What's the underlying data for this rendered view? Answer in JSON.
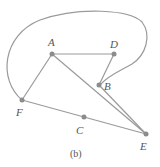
{
  "diagram": {
    "caption": "(b)",
    "colors": {
      "edge": "#9a9a9a",
      "node": "#8c8c8c",
      "text": "#555555"
    },
    "nodes": [
      {
        "id": "A",
        "label": "A",
        "x": 52,
        "y": 54
      },
      {
        "id": "D",
        "label": "D",
        "x": 114,
        "y": 54
      },
      {
        "id": "B",
        "label": "B",
        "x": 99,
        "y": 85
      },
      {
        "id": "F",
        "label": "F",
        "x": 22,
        "y": 100
      },
      {
        "id": "C",
        "label": "C",
        "x": 84,
        "y": 117
      },
      {
        "id": "E",
        "label": "E",
        "x": 146,
        "y": 134
      }
    ],
    "edges": [
      {
        "from": "A",
        "to": "D",
        "shape": "straight"
      },
      {
        "from": "A",
        "to": "F",
        "shape": "straight"
      },
      {
        "from": "A",
        "to": "E",
        "shape": "straight"
      },
      {
        "from": "D",
        "to": "B",
        "shape": "straight"
      },
      {
        "from": "B",
        "to": "E",
        "shape": "straight"
      },
      {
        "from": "F",
        "to": "C",
        "shape": "straight"
      },
      {
        "from": "C",
        "to": "E",
        "shape": "straight"
      },
      {
        "from": "F",
        "to": "B",
        "shape": "curved-loop-over-top"
      }
    ]
  }
}
